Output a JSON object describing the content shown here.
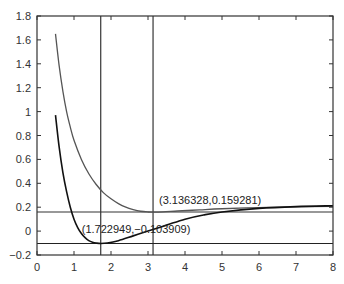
{
  "chart_data": {
    "type": "line",
    "title": "",
    "xlabel": "",
    "ylabel": "",
    "xlim": [
      0,
      8
    ],
    "ylim": [
      -0.2,
      1.8
    ],
    "grid": false,
    "legend": null,
    "x_ticks": [
      0,
      1,
      2,
      3,
      4,
      5,
      6,
      7,
      8
    ],
    "x_tick_labels": [
      "0",
      "1",
      "2",
      "3",
      "4",
      "5",
      "6",
      "7",
      "8"
    ],
    "y_ticks": [
      -0.2,
      0,
      0.2,
      0.4,
      0.6,
      0.8,
      1,
      1.2,
      1.4,
      1.6,
      1.8
    ],
    "y_tick_labels": [
      "−0.2",
      "0",
      "0.2",
      "0.4",
      "0.6",
      "0.8",
      "1",
      "1.2",
      "1.4",
      "1.6",
      "1.8"
    ],
    "series": [
      {
        "name": "upper-curve",
        "color": "#555555",
        "x": [
          0.5,
          0.6,
          0.7,
          0.8,
          0.9,
          1.0,
          1.2,
          1.4,
          1.6,
          1.8,
          2.0,
          2.2,
          2.4,
          2.6,
          2.8,
          3.0,
          3.136,
          3.4,
          3.8,
          4.4,
          5.0,
          6.0,
          7.0,
          8.0
        ],
        "y": [
          1.65,
          1.38,
          1.17,
          1.0,
          0.87,
          0.76,
          0.6,
          0.48,
          0.39,
          0.32,
          0.27,
          0.23,
          0.2,
          0.18,
          0.166,
          0.16,
          0.159,
          0.161,
          0.168,
          0.178,
          0.187,
          0.197,
          0.203,
          0.207
        ]
      },
      {
        "name": "lower-curve",
        "color": "#111111",
        "x": [
          0.5,
          0.6,
          0.7,
          0.8,
          0.9,
          1.0,
          1.1,
          1.2,
          1.3,
          1.4,
          1.5,
          1.6,
          1.723,
          1.9,
          2.2,
          2.6,
          3.0,
          3.5,
          4.0,
          4.5,
          5.0,
          6.0,
          7.0,
          8.0
        ],
        "y": [
          0.97,
          0.7,
          0.49,
          0.33,
          0.2,
          0.1,
          0.03,
          -0.02,
          -0.055,
          -0.08,
          -0.093,
          -0.1,
          -0.104,
          -0.1,
          -0.08,
          -0.04,
          0.0,
          0.05,
          0.1,
          0.135,
          0.16,
          0.19,
          0.205,
          0.212
        ]
      }
    ],
    "reference_lines": {
      "vertical": [
        {
          "x": 1.722949,
          "color": "#222222"
        },
        {
          "x": 3.136328,
          "color": "#222222"
        }
      ],
      "horizontal": [
        {
          "y": 0.159281,
          "color": "#333333"
        },
        {
          "y": -0.103909,
          "color": "#222222"
        }
      ]
    },
    "annotations": [
      {
        "text": "(3.136328,0.159281)",
        "x": 3.136328,
        "y": 0.159281
      },
      {
        "text": "(1.722949,−0.103909)",
        "x": 1.722949,
        "y": -0.103909
      }
    ]
  },
  "plot_area": {
    "left": 37,
    "top": 16,
    "right": 333,
    "bottom": 255
  }
}
